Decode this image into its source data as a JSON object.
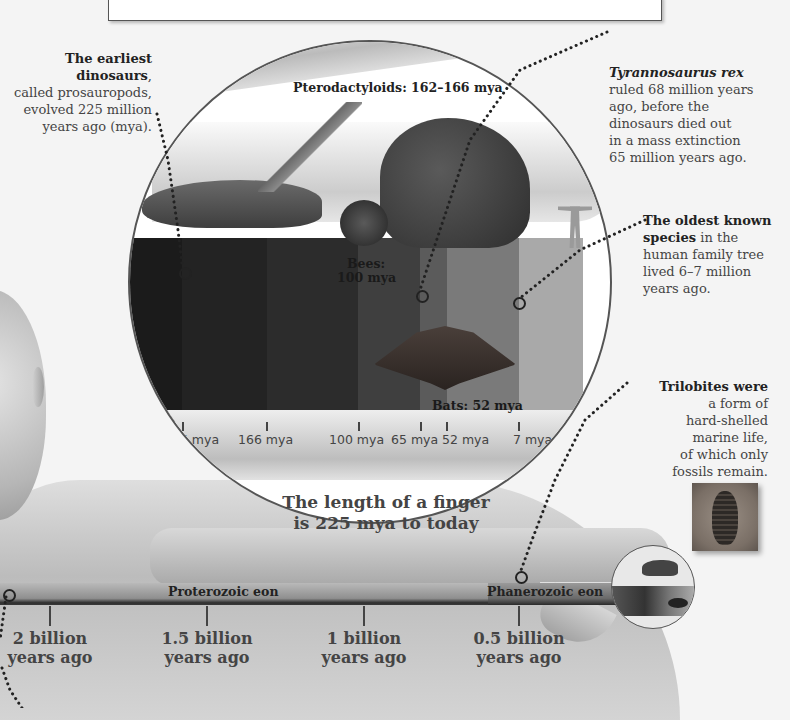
{
  "top_box": {},
  "callouts": {
    "earliest_dinosaurs": {
      "bold": "The earliest dinosaurs",
      "rest": ", called prosauropods, evolved 225 million years ago (mya).",
      "lines": [
        "The earliest dinosaurs,",
        "called prosauropods,",
        "evolved 225 million",
        "years ago (mya)."
      ]
    },
    "trex": {
      "italic": "Tyrannosaurus rex",
      "lines": [
        "ruled 68 million years",
        "ago, before the",
        "dinosaurs died out",
        "in a mass extinction",
        "65 million years ago."
      ]
    },
    "human": {
      "bold_lines": [
        "The oldest known",
        "species"
      ],
      "lines": [
        " in the",
        "human family tree",
        "lived 6–7 million",
        "years ago."
      ]
    },
    "trilobites": {
      "bold": "Trilobites were",
      "lines": [
        "a form of",
        "hard-shelled",
        "marine life,",
        "of which only",
        "fossils remain."
      ]
    }
  },
  "lens": {
    "labels": {
      "pterodactyloids": "Pterodactyloids: 162–166 mya",
      "bees_1": "Bees:",
      "bees_2": "100 mya",
      "bats": "Bats: 52 mya"
    },
    "ticks": [
      {
        "label": "225 mya",
        "x": 180
      },
      {
        "label": "166 mya",
        "x": 265
      },
      {
        "label": "100 mya",
        "x": 356
      },
      {
        "label": "65 mya",
        "x": 418
      },
      {
        "label": "52 mya",
        "x": 445
      },
      {
        "label": "7 mya",
        "x": 517
      }
    ],
    "caption_1": "The length of a finger",
    "caption_2": "is 225 mya to today"
  },
  "eon_bar": {
    "proterozoic": "Proterozoic eon",
    "phanerozoic": "Phanerozoic eon",
    "ticks": [
      {
        "line1": "2 billion",
        "line2": "years ago",
        "x": 50
      },
      {
        "line1": "1.5 billion",
        "line2": "years ago",
        "x": 207
      },
      {
        "line1": "1 billion",
        "line2": "years ago",
        "x": 364
      },
      {
        "line1": "0.5 billion",
        "line2": "years ago",
        "x": 519
      }
    ]
  },
  "colors": {
    "background": "#f4f4f4",
    "text": "#444444",
    "band_dark": "#1e1e1e",
    "band_mid": "#4a4a4a",
    "band_light": "#8a8a8a"
  }
}
